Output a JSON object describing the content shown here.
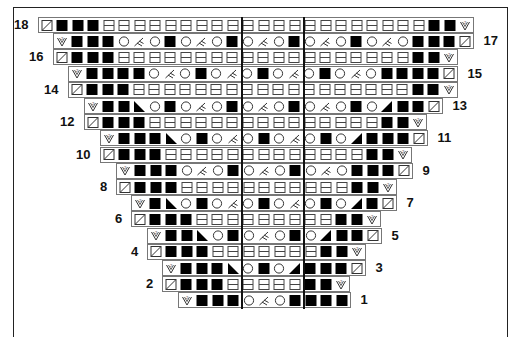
{
  "chart": {
    "title": "",
    "cell_width": 15.5,
    "row_height": 16.2,
    "top": 17,
    "center_lines_x": [
      242,
      304
    ],
    "legend_symbols": {
      "D": "decrease-slash",
      "B": "black-no-stitch",
      "H": "knit-double-bar",
      "O": "yarn-over",
      "K": "k2tog-branch",
      "V": "increase-v2",
      "L": "left-black-triangle",
      "R": "right-black-triangle"
    },
    "rows": [
      {
        "num": "18",
        "side": "left",
        "start": 38,
        "cells": "DBBBHHHHHHHHH|HHHH|HHHHHHHHBBV"
      },
      {
        "num": "17",
        "side": "right",
        "start": 53,
        "cells": "VBBBOKOBOKOB|OKOB|OKOBOKOBBBD"
      },
      {
        "num": "16",
        "side": "left",
        "start": 53,
        "cells": "DBBBHHHHHHHH|HHHH|HHHHHHHBBV"
      },
      {
        "num": "15",
        "side": "right",
        "start": 68,
        "cells": "VBBBBOKOBOK|OBOK|OBOKOBBBBD"
      },
      {
        "num": "14",
        "side": "left",
        "start": 68,
        "cells": "DBBBHHHHHHH|HHHH|HHHHHHHBBV"
      },
      {
        "num": "13",
        "side": "right",
        "start": 84,
        "cells": "VBBLOBOKOB|OKOB|OKOBORBBD"
      },
      {
        "num": "12",
        "side": "left",
        "start": 84,
        "cells": "DBBBHHHHHH|HHHH|HHHHHBBV"
      },
      {
        "num": "11",
        "side": "right",
        "start": 100,
        "cells": "VBBBLOBOK|OBOK|OBORBBBD"
      },
      {
        "num": "10",
        "side": "left",
        "start": 100,
        "cells": "DBBBHHHHH|HHHH|HHHHBBV"
      },
      {
        "num": "9",
        "side": "right",
        "start": 116,
        "cells": "VBBBOKOB|OKOB|OKOBBBD"
      },
      {
        "num": "8",
        "side": "left",
        "start": 116,
        "cells": "DBBBHHHH|HHHH|HHHBBV"
      },
      {
        "num": "7",
        "side": "right",
        "start": 131,
        "cells": "VBLOBOK|OBOK|OBORBD"
      },
      {
        "num": "6",
        "side": "left",
        "start": 131,
        "cells": "DBBBHHH|HHHH|HHBBV"
      },
      {
        "num": "5",
        "side": "right",
        "start": 147,
        "cells": "VBBLOB|OKOB|ORBBD"
      },
      {
        "num": "4",
        "side": "left",
        "start": 147,
        "cells": "DBBBHH|HHHH|HBBV"
      },
      {
        "num": "3",
        "side": "right",
        "start": 162,
        "cells": "VBBBL|OBOR|BBBD"
      },
      {
        "num": "2",
        "side": "left",
        "start": 162,
        "cells": "DBBBH|HHHH|BBV"
      },
      {
        "num": "1",
        "side": "right",
        "start": 178,
        "cells": "VBBB|OKOB|BBB"
      }
    ]
  }
}
